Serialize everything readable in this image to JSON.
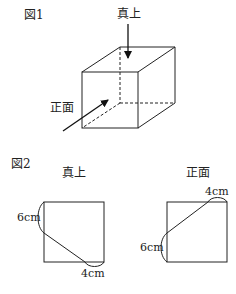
{
  "figure1": {
    "title": "図1",
    "top_view_label": "真上",
    "front_view_label": "正面"
  },
  "figure2": {
    "title": "図2",
    "top_view": {
      "label": "真上",
      "side_length_label": "6cm",
      "bottom_length_label": "4cm"
    },
    "front_view": {
      "label": "正面",
      "top_length_label": "4cm",
      "side_length_label": "6cm"
    }
  }
}
